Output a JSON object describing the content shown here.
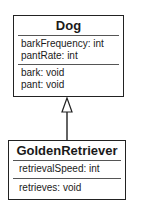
{
  "diagram": {
    "type": "uml-class-inheritance",
    "classes": [
      {
        "name": "Dog",
        "attributes": [
          "barkFrequency: int",
          "pantRate: int"
        ],
        "methods": [
          "bark: void",
          "pant: void"
        ]
      },
      {
        "name": "GoldenRetriever",
        "attributes": [
          "retrievalSpeed: int"
        ],
        "methods": [
          "retrieves: void"
        ]
      }
    ],
    "relationships": [
      {
        "from": "GoldenRetriever",
        "to": "Dog",
        "kind": "generalization",
        "arrow": "hollow-triangle"
      }
    ]
  }
}
